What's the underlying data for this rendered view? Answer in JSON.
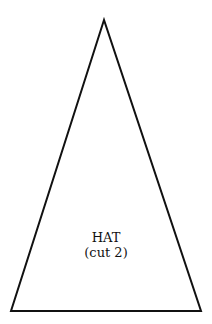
{
  "piece": {
    "name": "HAT",
    "instruction": "(cut 2)",
    "shape": "triangle",
    "vertices": {
      "apex": [
        104,
        20
      ],
      "bottom_left": [
        11,
        311
      ],
      "bottom_right": [
        201,
        311
      ]
    },
    "stroke_color": "#111111",
    "fill_color": "#ffffff"
  }
}
